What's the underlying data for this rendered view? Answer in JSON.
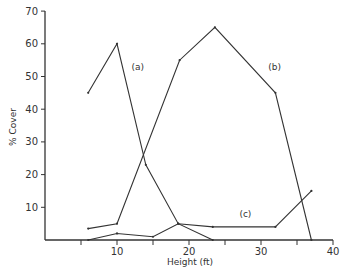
{
  "chart_data": {
    "type": "line",
    "title": "",
    "xlabel": "Height (ft)",
    "ylabel": "% Cover",
    "xlim": [
      0,
      40
    ],
    "ylim": [
      0,
      70
    ],
    "x_ticks": [
      5,
      10,
      15,
      20,
      25,
      30,
      35,
      40
    ],
    "x_tick_labels": [
      "",
      "10",
      "",
      "20",
      "",
      "30",
      "",
      "40"
    ],
    "y_ticks": [
      10,
      20,
      30,
      40,
      50,
      60,
      70
    ],
    "y_tick_labels": [
      "10",
      "20",
      "30",
      "40",
      "50",
      "60",
      "70"
    ],
    "grid": false,
    "legend": "inline labels",
    "series": [
      {
        "name": "(a)",
        "x": [
          6,
          10,
          14,
          18.5,
          23.3
        ],
        "values": [
          45,
          60,
          23,
          5,
          0
        ],
        "label_pos": [
          12,
          52
        ]
      },
      {
        "name": "(b)",
        "x": [
          6,
          10,
          18.7,
          23.6,
          32,
          37
        ],
        "values": [
          3.5,
          5,
          55,
          65,
          45,
          0
        ],
        "label_pos": [
          31,
          52
        ]
      },
      {
        "name": "(c)",
        "x": [
          6,
          10,
          15,
          18.5,
          23.3,
          32,
          37
        ],
        "values": [
          0,
          2,
          1,
          5,
          4,
          4,
          15
        ],
        "label_pos": [
          27,
          7
        ]
      }
    ]
  }
}
